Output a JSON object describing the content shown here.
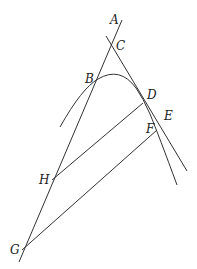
{
  "diagram": {
    "type": "geometry",
    "stroke_color": "#333333",
    "points": {
      "A": {
        "label": "A",
        "x": 121,
        "y": 22,
        "lx": 110,
        "ly": 24
      },
      "C": {
        "label": "C",
        "x": 113,
        "y": 50,
        "lx": 116,
        "ly": 50
      },
      "B": {
        "label": "B",
        "x": 98,
        "y": 79,
        "lx": 85,
        "ly": 83
      },
      "D": {
        "label": "D",
        "x": 143,
        "y": 103,
        "lx": 147,
        "ly": 99
      },
      "E": {
        "label": "E",
        "x": 159,
        "y": 124,
        "lx": 164,
        "ly": 120
      },
      "F": {
        "label": "F",
        "x": 156,
        "y": 130,
        "lx": 146,
        "ly": 133
      },
      "H": {
        "label": "H",
        "x": 52,
        "y": 180,
        "lx": 39,
        "ly": 184
      },
      "G": {
        "label": "G",
        "x": 22,
        "y": 250,
        "lx": 10,
        "ly": 254
      }
    },
    "labels": [
      "A",
      "B",
      "C",
      "D",
      "E",
      "F",
      "G",
      "H"
    ]
  }
}
